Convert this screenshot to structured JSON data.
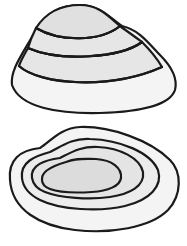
{
  "diagram": {
    "colors": {
      "stroke": "#1a1a1a",
      "background": "#ffffff",
      "band_light": "#f4f4f4",
      "band_mid": "#e8e8e8",
      "band_dark": "#dcdcdc"
    },
    "top_shell": {
      "label": "",
      "rings": 4,
      "shapes": [
        {
          "fill": "#f4f4f4",
          "d": "M12,85 C10,70 22,55 36,30 C45,14 60,5 80,5 C100,5 110,18 122,26 C140,30 150,45 160,55 C170,65 178,78 175,90 C170,105 140,112 100,113 C60,114 20,108 12,85 Z"
        },
        {
          "fill": "#e6e6e6",
          "d": "M19,66 C40,85 110,90 162,67 C155,55 148,48 142,42 C120,58 60,62 28,48 C24,55 21,60 19,66 Z"
        },
        {
          "fill": "#e6e6e6",
          "d": "M28,48 C60,62 120,58 142,42 C134,36 128,32 120,26 C100,42 60,42 36,28 C33,34 30,41 28,48 Z"
        },
        {
          "fill": "#e0e0e0",
          "d": "M36,28 C60,42 100,42 120,26 C110,18 100,5 80,5 C60,5 45,14 36,28 Z"
        }
      ],
      "ring_lines": [
        "M19,66 C40,85 110,90 162,67",
        "M28,48 C60,62 120,58 142,42",
        "M36,28 C60,42 100,42 120,26"
      ]
    },
    "bottom_shell": {
      "label": "",
      "rings": 5,
      "shapes": [
        {
          "fill": "#f4f4f4",
          "d": "M10,180 C8,160 20,150 40,148 C50,142 60,128 80,127 C110,126 150,140 170,160 C182,172 182,195 168,210 C150,228 110,234 75,230 C40,226 12,210 10,180 Z"
        },
        {
          "fill": "#ececec",
          "d": "M22,178 C20,162 35,156 50,152 C62,146 72,138 90,139 C120,140 150,152 158,170 C163,186 150,200 125,206 C100,212 60,210 40,200 C30,195 23,188 22,178 Z"
        },
        {
          "fill": "#e4e4e4",
          "d": "M32,178 C30,165 45,160 60,158 C72,152 82,146 98,147 C120,148 140,158 143,172 C145,186 130,194 110,197 C90,200 60,198 45,192 C37,189 33,184 32,178 Z"
        },
        {
          "fill": "#dcdcdc",
          "d": "M42,180 C41,172 52,166 66,162 C76,158 84,159 96,159 C112,160 122,168 121,178 C120,186 108,191 92,192 C76,193 58,192 50,189 C45,187 42,184 42,180 Z"
        }
      ]
    }
  }
}
